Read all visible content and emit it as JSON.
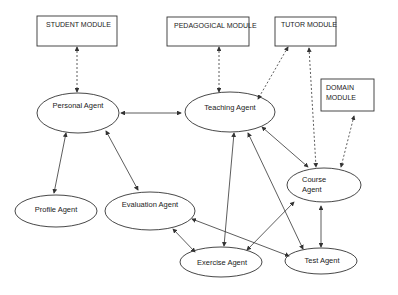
{
  "modules": {
    "student": "STUDENT   MODULE",
    "pedagogical": "PEDAGOGICAL MODULE",
    "tutor": "TUTOR MODULE",
    "domain_line1": "DOMAIN",
    "domain_line2": "MODULE"
  },
  "agents": {
    "personal": "Personal Agent",
    "teaching": "Teaching Agent",
    "profile": "Profile Agent",
    "evaluation": "Evaluation Agent",
    "course_line1": "Course",
    "course_line2": "Agent",
    "exercise": "Exercise Agent",
    "test": "Test Agent"
  },
  "colors": {
    "stroke": "#333333",
    "background": "#ffffff"
  }
}
